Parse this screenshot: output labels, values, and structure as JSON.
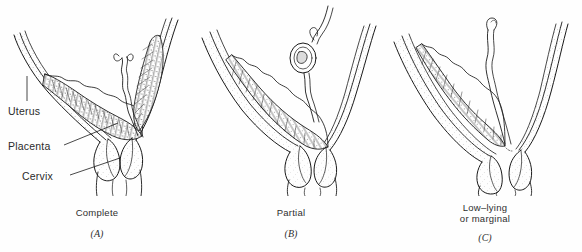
{
  "figure": {
    "background_color": "#fefefe",
    "ink_color": "#1a1a1a"
  },
  "annotations": {
    "uterus": "Uterus",
    "placenta": "Placenta",
    "cervix": "Cervix"
  },
  "panels": [
    {
      "id": "a",
      "caption_line1": "Complete",
      "caption_line2": "",
      "letter": "(A)"
    },
    {
      "id": "b",
      "caption_line1": "Partial",
      "caption_line2": "",
      "letter": "(B)"
    },
    {
      "id": "c",
      "caption_line1": "Low–lying",
      "caption_line2": "or marginal",
      "letter": "(C)"
    }
  ]
}
